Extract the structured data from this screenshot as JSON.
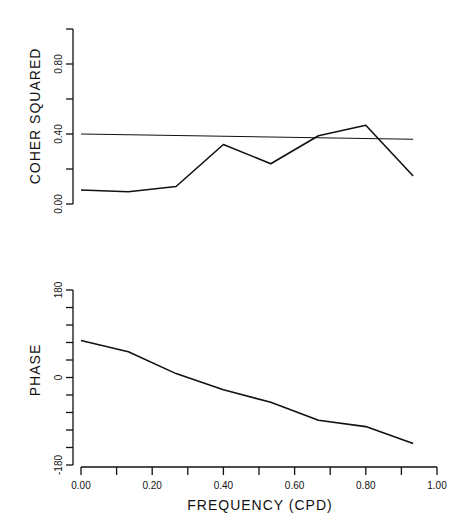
{
  "chart_data": [
    {
      "type": "line",
      "panel": "top",
      "title": "",
      "xlabel": "",
      "ylabel": "COHER SQUARED",
      "ylim": [
        0,
        1.0
      ],
      "xlim": [
        0,
        1.0
      ],
      "yticks": [
        0,
        0.2,
        0.4,
        0.6,
        0.8,
        1.0
      ],
      "ytick_labels": [
        "0.00",
        "",
        "0.40",
        "",
        "0.80",
        ""
      ],
      "grid": false,
      "series": [
        {
          "name": "coherence squared",
          "x": [
            0.0,
            0.133,
            0.267,
            0.4,
            0.533,
            0.667,
            0.8,
            0.933
          ],
          "values": [
            0.08,
            0.07,
            0.1,
            0.34,
            0.23,
            0.39,
            0.45,
            0.16
          ]
        },
        {
          "name": "significance level",
          "x": [
            0.0,
            0.933
          ],
          "values": [
            0.4,
            0.37
          ]
        }
      ]
    },
    {
      "type": "line",
      "panel": "bottom",
      "title": "",
      "xlabel": "FREQUENCY (CPD)",
      "ylabel": "PHASE",
      "ylim": [
        -180,
        180
      ],
      "xlim": [
        0,
        1.0
      ],
      "yticks": [
        -180,
        -144,
        -108,
        -72,
        -36,
        0,
        36,
        72,
        108,
        144,
        180
      ],
      "ytick_labels": [
        "-180",
        "",
        "",
        "",
        "",
        "0",
        "",
        "",
        "",
        "",
        "180"
      ],
      "xticks": [
        0,
        0.1,
        0.2,
        0.3,
        0.4,
        0.5,
        0.6,
        0.7,
        0.8,
        0.9,
        1.0
      ],
      "xtick_labels": [
        "0.00",
        "",
        "0.20",
        "",
        "0.40",
        "",
        "0.60",
        "",
        "0.80",
        "",
        "1.00"
      ],
      "grid": false,
      "series": [
        {
          "name": "phase",
          "x": [
            0.0,
            0.133,
            0.267,
            0.4,
            0.533,
            0.667,
            0.8,
            0.933
          ],
          "values": [
            76,
            53,
            8,
            -25,
            -51,
            -88,
            -101,
            -136
          ]
        }
      ]
    }
  ],
  "labels": {
    "top_ylabel": "COHER SQUARED",
    "bottom_ylabel": "PHASE",
    "xlabel": "FREQUENCY (CPD)"
  }
}
